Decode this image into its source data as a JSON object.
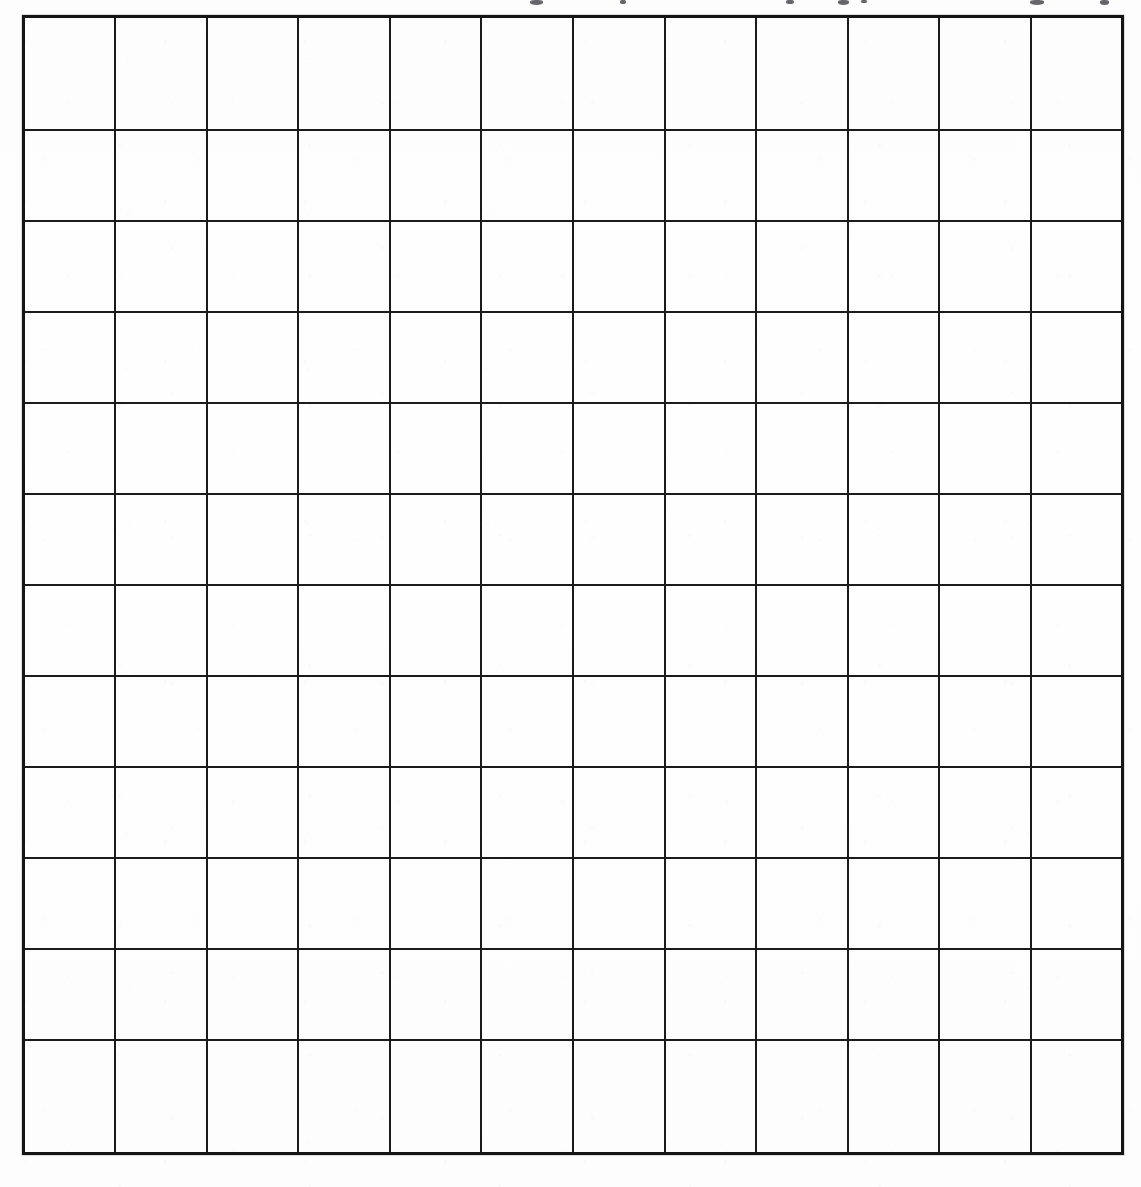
{
  "page": {
    "background_color": "#fefefe",
    "width": 1141,
    "height": 1187
  },
  "grid": {
    "name": "blank-square-grid",
    "columns": 12,
    "rows": 12,
    "total_cells": 144,
    "cell_width_px": 92,
    "cell_height_px": 95,
    "left_px": 22,
    "top_px": 15,
    "right_px": 1124,
    "bottom_px": 1155,
    "line_color": "#1b1b1b",
    "border_color": "#151515",
    "interior_line_width_px": 2,
    "outer_border_width_px": 3,
    "cell_fill": "",
    "cells": [
      [
        "",
        "",
        "",
        "",
        "",
        "",
        "",
        "",
        "",
        "",
        "",
        ""
      ],
      [
        "",
        "",
        "",
        "",
        "",
        "",
        "",
        "",
        "",
        "",
        "",
        ""
      ],
      [
        "",
        "",
        "",
        "",
        "",
        "",
        "",
        "",
        "",
        "",
        "",
        ""
      ],
      [
        "",
        "",
        "",
        "",
        "",
        "",
        "",
        "",
        "",
        "",
        "",
        ""
      ],
      [
        "",
        "",
        "",
        "",
        "",
        "",
        "",
        "",
        "",
        "",
        "",
        ""
      ],
      [
        "",
        "",
        "",
        "",
        "",
        "",
        "",
        "",
        "",
        "",
        "",
        ""
      ],
      [
        "",
        "",
        "",
        "",
        "",
        "",
        "",
        "",
        "",
        "",
        "",
        ""
      ],
      [
        "",
        "",
        "",
        "",
        "",
        "",
        "",
        "",
        "",
        "",
        "",
        ""
      ],
      [
        "",
        "",
        "",
        "",
        "",
        "",
        "",
        "",
        "",
        "",
        "",
        ""
      ],
      [
        "",
        "",
        "",
        "",
        "",
        "",
        "",
        "",
        "",
        "",
        "",
        ""
      ],
      [
        "",
        "",
        "",
        "",
        "",
        "",
        "",
        "",
        "",
        "",
        "",
        ""
      ],
      [
        "",
        "",
        "",
        "",
        "",
        "",
        "",
        "",
        "",
        "",
        "",
        ""
      ]
    ]
  },
  "clipped_top_text": {
    "note": "Descender fragments of a heading cropped off above the top edge; no characters legible.",
    "fragments": [
      {
        "x": 530,
        "y": 0,
        "w": 13,
        "h": 5
      },
      {
        "x": 620,
        "y": 0,
        "w": 6,
        "h": 4
      },
      {
        "x": 786,
        "y": 0,
        "w": 8,
        "h": 4
      },
      {
        "x": 838,
        "y": 0,
        "w": 11,
        "h": 5
      },
      {
        "x": 861,
        "y": 0,
        "w": 6,
        "h": 3
      },
      {
        "x": 1030,
        "y": 0,
        "w": 14,
        "h": 5
      },
      {
        "x": 1100,
        "y": 0,
        "w": 9,
        "h": 5
      }
    ]
  }
}
